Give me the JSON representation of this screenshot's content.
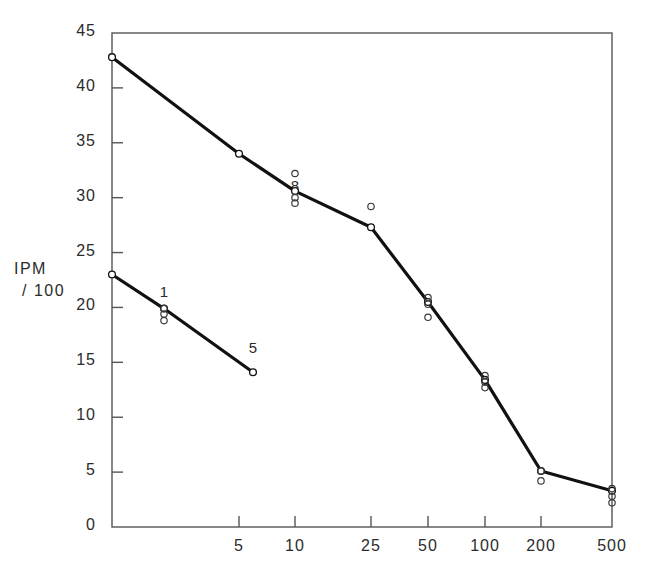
{
  "chart_data": {
    "type": "line",
    "title": "",
    "subtitle": "",
    "xlabel": "",
    "ylabel": "IPM /100",
    "ylabel_lines": [
      "IPM",
      "/ 100"
    ],
    "x_scale": "ordinal-log-like",
    "x_tick_labels": [
      "5",
      "10",
      "25",
      "50",
      "100",
      "200",
      "500"
    ],
    "x_tick_pixels": [
      239,
      295,
      371,
      428,
      485,
      541,
      612
    ],
    "y_tick_labels": [
      "0",
      "5",
      "10",
      "15",
      "20",
      "25",
      "30",
      "35",
      "40",
      "45"
    ],
    "y_ticks": [
      0,
      5,
      10,
      15,
      20,
      25,
      30,
      35,
      40,
      45
    ],
    "ylim": [
      0,
      45
    ],
    "grid": false,
    "legend": null,
    "axis_frame": "box",
    "series": [
      {
        "name": "upper curve",
        "marker": "open-circle",
        "x_pixels": [
          112,
          239,
          295,
          371,
          428,
          485,
          541,
          612
        ],
        "x_labels": [
          "0",
          "5",
          "10",
          "25",
          "50",
          "100",
          "200",
          "500"
        ],
        "values": [
          42.8,
          34.0,
          30.6,
          27.3,
          20.5,
          13.4,
          5.1,
          3.3
        ]
      },
      {
        "name": "lower curve",
        "marker": "open-circle",
        "x_pixels": [
          112,
          164,
          253
        ],
        "x_labels": [
          "0",
          "1",
          "5"
        ],
        "values": [
          23.0,
          19.9,
          14.1
        ]
      }
    ],
    "scatter_points": [
      {
        "x_pixel": 295,
        "value": 32.2
      },
      {
        "x_pixel": 295,
        "value": 30.0
      },
      {
        "x_pixel": 295,
        "value": 29.5
      },
      {
        "x_pixel": 371,
        "value": 29.2
      },
      {
        "x_pixel": 428,
        "value": 20.9
      },
      {
        "x_pixel": 428,
        "value": 20.3
      },
      {
        "x_pixel": 428,
        "value": 19.1
      },
      {
        "x_pixel": 485,
        "value": 13.8
      },
      {
        "x_pixel": 485,
        "value": 13.2
      },
      {
        "x_pixel": 485,
        "value": 12.7
      },
      {
        "x_pixel": 541,
        "value": 5.1
      },
      {
        "x_pixel": 541,
        "value": 4.2
      },
      {
        "x_pixel": 612,
        "value": 3.5
      },
      {
        "x_pixel": 612,
        "value": 2.8
      },
      {
        "x_pixel": 612,
        "value": 2.2
      },
      {
        "x_pixel": 164,
        "value": 19.9
      },
      {
        "x_pixel": 164,
        "value": 19.4
      },
      {
        "x_pixel": 164,
        "value": 18.8
      }
    ],
    "annotations": [
      {
        "text": "1",
        "x_pixel": 164,
        "value": 21.3
      },
      {
        "text": "8",
        "x_pixel": 295,
        "value": 31.0
      },
      {
        "text": "5",
        "x_pixel": 253,
        "value": 16.2
      }
    ]
  },
  "colors": {
    "line": "#111111",
    "axis": "#555555",
    "text": "#2b2b2b",
    "background": "#ffffff",
    "marker_fill": "#ffffff"
  }
}
